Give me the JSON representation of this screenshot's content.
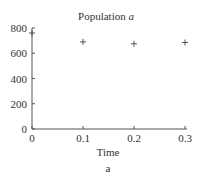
{
  "chart_data": {
    "type": "scatter",
    "title": "Population a",
    "title_prefix": "Population ",
    "title_var": "a",
    "xlabel": "Time",
    "ylabel": "",
    "caption": "a",
    "xlim": [
      0,
      0.3
    ],
    "ylim": [
      0,
      800
    ],
    "xticks": [
      "0",
      "0.1",
      "0.2",
      "0.3"
    ],
    "yticks": [
      "0",
      "200",
      "400",
      "600",
      "800"
    ],
    "grid": false,
    "marker": "+",
    "series": [
      {
        "name": "Population a",
        "x": [
          0,
          0.1,
          0.2,
          0.3
        ],
        "y": [
          760,
          690,
          675,
          685
        ]
      }
    ]
  }
}
